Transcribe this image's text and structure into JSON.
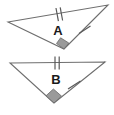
{
  "figure": {
    "background_color": "#ffffff",
    "line_color": "#6e6e6e",
    "tick_color": "#5a5a5a",
    "right_angle_fill": "#9a9a9a",
    "label_color": "#1a1a1a",
    "triangles": [
      {
        "id": "triangle-a",
        "label": "A",
        "label_x": 58,
        "label_y": 32,
        "vertices": {
          "left": {
            "x": 8,
            "y": 22
          },
          "right": {
            "x": 108,
            "y": 5
          },
          "bottom": {
            "x": 64,
            "y": 49
          }
        },
        "points": "8,22 108,5 64,49",
        "marks": {
          "top_edge_ticks": 2,
          "right_edge_ticks": 1,
          "right_angle_vertex": "bottom"
        }
      },
      {
        "id": "triangle-b",
        "label": "B",
        "label_x": 56,
        "label_y": 81,
        "vertices": {
          "left": {
            "x": 10,
            "y": 63
          },
          "right": {
            "x": 105,
            "y": 62
          },
          "bottom": {
            "x": 54,
            "y": 103
          }
        },
        "points": "10,63 105,62 54,103",
        "marks": {
          "top_edge_ticks": 2,
          "right_edge_ticks": 1,
          "right_angle_vertex": "bottom"
        }
      }
    ]
  }
}
